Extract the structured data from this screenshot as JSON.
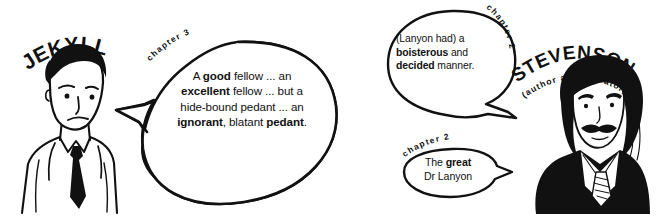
{
  "illustration": {
    "background_color": "#ffffff",
    "ink_color": "#111111",
    "panels": [
      {
        "character": "JEKYLL",
        "chapter_label": "chapter 3"
      },
      {
        "character": "STEVENSON",
        "subtitle": "(author and narrator)",
        "chapter_labels": [
          "chapter 2",
          "chapter 2"
        ]
      }
    ]
  },
  "left_panel": {
    "character_name": "JEKYLL",
    "chapter_label": "chapter 3",
    "quote": {
      "line1_a": "A ",
      "line1_bold": "good",
      "line1_b": " fellow ... an",
      "line2_bold": "excellent",
      "line2_b": " fellow ... but a",
      "line3": "hide-bound pedant ... an",
      "line4_bold": "ignorant",
      "line4_mid": ", blatant ",
      "line4_bold2": "pedant",
      "line4_end": "."
    }
  },
  "right_panel": {
    "character_name": "STEVENSON",
    "character_subtitle": "(author and narrator)",
    "bubble_top": {
      "chapter_label": "chapter 2",
      "line1": "(Lanyon had) a",
      "line2_bold": "boisterous",
      "line2_rest": " and",
      "line3_bold": "decided",
      "line3_rest": " manner."
    },
    "bubble_bottom": {
      "chapter_label": "chapter 2",
      "line1_a": "The ",
      "line1_bold": "great",
      "line2": "Dr Lanyon"
    }
  }
}
